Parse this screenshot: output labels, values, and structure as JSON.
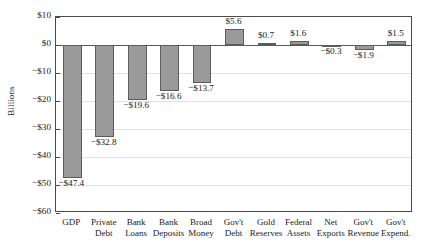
{
  "chart_data": {
    "type": "bar",
    "title": "",
    "xlabel": "",
    "ylabel": "Billions",
    "ylim": [
      -60,
      10
    ],
    "ytick_step": 10,
    "grid": true,
    "legend": "none",
    "bar_color": "#9a9a9a",
    "bar_edge_color": "#5c5c5c",
    "categories": [
      "GDP",
      "Private\nDebt",
      "Bank\nLoans",
      "Bank\nDeposits",
      "Broad\nMoney",
      "Gov't\nDebt",
      "Gold\nReserves",
      "Federal\nAssets",
      "Net\nExports",
      "Gov't\nRevenue",
      "Gov't\nExpend."
    ],
    "values": [
      -47.4,
      -32.8,
      -19.6,
      -16.6,
      -13.7,
      5.6,
      0.7,
      1.6,
      -0.3,
      -1.9,
      1.5
    ],
    "data_labels": [
      "−$47.4",
      "−$32.8",
      "−$19.6",
      "−$16.6",
      "−$13.7",
      "$5.6",
      "$0.7",
      "$1.6",
      "−$0.3",
      "−$1.9",
      "$1.5"
    ],
    "ytick_labels": [
      "$10",
      "$0",
      "−$10",
      "−$20",
      "−$30",
      "−$40",
      "−$50",
      "−$60"
    ],
    "ytick_values": [
      10,
      0,
      -10,
      -20,
      -30,
      -40,
      -50,
      -60
    ]
  }
}
